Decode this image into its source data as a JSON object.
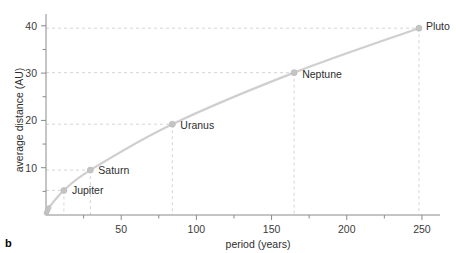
{
  "panel": {
    "letter": "b"
  },
  "chart_data": {
    "type": "scatter",
    "title": "",
    "xlabel": "period (years)",
    "ylabel": "average distance (AU)",
    "xlim": [
      0,
      262
    ],
    "ylim": [
      0,
      42.5
    ],
    "grid": "dashed guide lines from labeled points to axes",
    "legend": "none",
    "x_major_ticks": [
      50,
      100,
      150,
      200,
      250
    ],
    "x_minor_ticks": [
      25,
      75,
      125,
      175,
      225
    ],
    "x_tick_labels": [
      "50",
      "100",
      "150",
      "200",
      "250"
    ],
    "y_major_ticks": [
      10,
      20,
      30,
      40
    ],
    "y_minor_ticks": [
      5,
      15,
      25,
      35
    ],
    "y_tick_labels": [
      "10",
      "20",
      "30",
      "40"
    ],
    "points": [
      {
        "name": "Mercury",
        "x": 0.24,
        "y": 0.39,
        "labeled": false
      },
      {
        "name": "Venus",
        "x": 0.62,
        "y": 0.72,
        "labeled": false
      },
      {
        "name": "Earth",
        "x": 1.0,
        "y": 1.0,
        "labeled": false
      },
      {
        "name": "Mars",
        "x": 1.88,
        "y": 1.52,
        "labeled": false
      },
      {
        "name": "Jupiter",
        "x": 11.9,
        "y": 5.2,
        "labeled": true
      },
      {
        "name": "Saturn",
        "x": 29.5,
        "y": 9.5,
        "labeled": true
      },
      {
        "name": "Uranus",
        "x": 84.0,
        "y": 19.2,
        "labeled": true
      },
      {
        "name": "Neptune",
        "x": 165.0,
        "y": 30.1,
        "labeled": true
      },
      {
        "name": "Pluto",
        "x": 248.0,
        "y": 39.5,
        "labeled": true
      }
    ]
  },
  "colors": {
    "curve": "#cfcfcf",
    "marker": "#c4c4c4",
    "guide_line": "#d4d4d4",
    "axis": "#8a8a8a",
    "text": "#2e2e2e"
  }
}
